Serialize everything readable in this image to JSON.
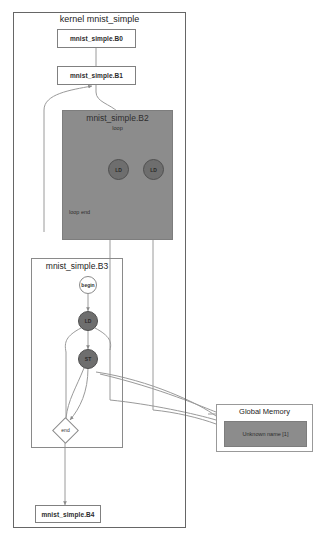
{
  "diagram": {
    "kernel": {
      "title": "kernel mnist_simple",
      "blocks": [
        {
          "label": "mnist_simple.B0"
        },
        {
          "label": "mnist_simple.B1"
        },
        {
          "label": "mnist_simple.B4"
        }
      ]
    },
    "loop_region": {
      "title": "mnist_simple.B2",
      "subtitle": "loop",
      "end_label": "loop end",
      "nodes": [
        {
          "label": "LD"
        },
        {
          "label": "LD"
        }
      ]
    },
    "body_region": {
      "title": "mnist_simple.B3",
      "nodes": [
        {
          "label": "begin"
        },
        {
          "label": "LD"
        },
        {
          "label": "ST"
        },
        {
          "label": "end"
        }
      ]
    },
    "global_memory": {
      "title": "Global Memory",
      "cells": [
        {
          "label": "Unknown name [1]"
        }
      ]
    },
    "watermark": ""
  }
}
